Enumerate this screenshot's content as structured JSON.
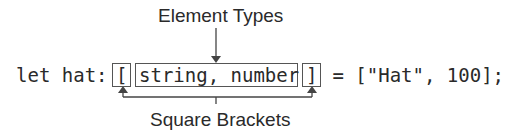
{
  "labels": {
    "top": "Element Types",
    "bottom": "Square Brackets"
  },
  "code": {
    "prefix": "let hat: ",
    "open_bracket": "[",
    "element_types": "string, number",
    "close_bracket": "]",
    "suffix": " = [\"Hat\", 100];"
  },
  "colors": {
    "text": "#2a2a2a",
    "lines": "#444444",
    "background": "#ffffff"
  }
}
